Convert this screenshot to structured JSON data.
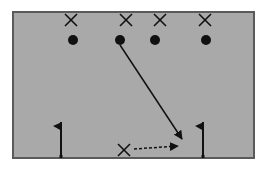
{
  "diagram": {
    "colors": {
      "background": "#ffffff",
      "field_fill": "#a9a9a9",
      "field_border": "#5a5a5a",
      "ink": "#111111"
    },
    "field": {
      "x": 13,
      "y": 12,
      "width": 241,
      "height": 146
    },
    "defenders": [
      {
        "id": "x1",
        "symbol": "X",
        "x": 71,
        "y": 20
      },
      {
        "id": "x2",
        "symbol": "X",
        "x": 126,
        "y": 20
      },
      {
        "id": "x3",
        "symbol": "X",
        "x": 160,
        "y": 20
      },
      {
        "id": "x4",
        "symbol": "X",
        "x": 205,
        "y": 20
      },
      {
        "id": "x5",
        "symbol": "X",
        "x": 124,
        "y": 150
      }
    ],
    "players": [
      {
        "id": "o1",
        "symbol": "dot",
        "x": 73,
        "y": 40
      },
      {
        "id": "o2",
        "symbol": "dot",
        "x": 120,
        "y": 40
      },
      {
        "id": "o3",
        "symbol": "dot",
        "x": 155,
        "y": 40
      },
      {
        "id": "o4",
        "symbol": "dot",
        "x": 206,
        "y": 40
      }
    ],
    "flags": [
      {
        "id": "flag-left",
        "x": 61,
        "top": 122,
        "bottom": 157
      },
      {
        "id": "flag-right",
        "x": 203,
        "top": 122,
        "bottom": 157
      }
    ],
    "paths": [
      {
        "id": "run-path",
        "style": "solid",
        "from": [
          120,
          45
        ],
        "to": [
          182,
          139
        ]
      },
      {
        "id": "pass-path",
        "style": "dashed",
        "from": [
          134,
          149
        ],
        "to": [
          178,
          146
        ]
      }
    ]
  }
}
